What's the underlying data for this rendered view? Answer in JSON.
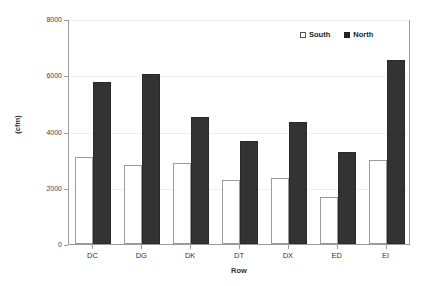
{
  "chart_data": {
    "type": "bar",
    "title": "",
    "xlabel": "Row",
    "ylabel": "(cfm)",
    "categories": [
      "DC",
      "DG",
      "DK",
      "DT",
      "DX",
      "ED",
      "EI"
    ],
    "series": [
      {
        "name": "South",
        "values": [
          3100,
          2800,
          2880,
          2280,
          2350,
          1680,
          3000
        ],
        "color": "#ffffff"
      },
      {
        "name": "North",
        "values": [
          5750,
          6050,
          4500,
          3680,
          4350,
          3280,
          6550
        ],
        "color": "#333333"
      }
    ],
    "ylim": [
      0,
      8000
    ],
    "yticks": [
      0,
      2000,
      4000,
      6000,
      8000
    ],
    "ytick_labels": [
      "0",
      "2000",
      "4000",
      "6000",
      "8000"
    ],
    "grid": true,
    "legend_position": "top-right",
    "legend": [
      "South",
      "North"
    ]
  },
  "axis": {
    "y_label": "(cfm)",
    "x_label": "Row"
  }
}
